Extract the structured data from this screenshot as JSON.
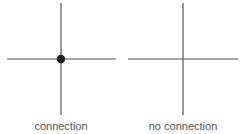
{
  "diagrams": [
    {
      "label": "connection",
      "connected": true
    },
    {
      "label": "no connection",
      "connected": false
    }
  ],
  "colors": {
    "line": "#555555",
    "dot": "#222222",
    "text": "#555555"
  }
}
